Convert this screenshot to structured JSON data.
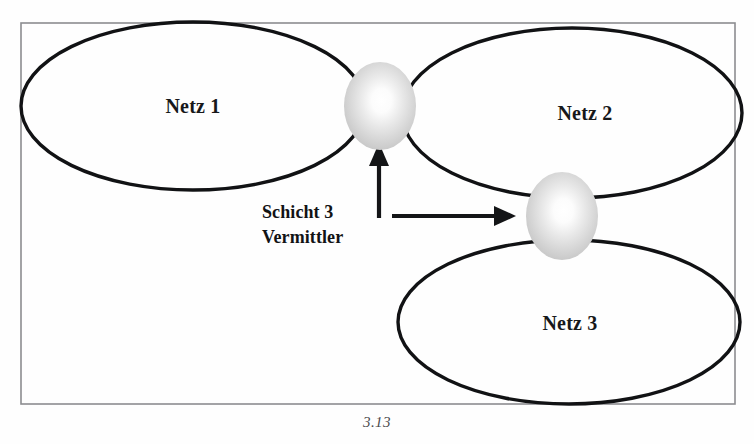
{
  "figure": {
    "caption": "3.13",
    "background_color": "#fefefe",
    "frame_color": "#8c8d90",
    "outline_color": "#111214",
    "text_color": "#17181a",
    "node_fill_center": "#ffffff",
    "node_fill_edge": "#c9c9c9"
  },
  "networks": [
    {
      "id": "netz-1",
      "label": "Netz 1",
      "cx": 193,
      "cy": 106,
      "rx": 172,
      "ry": 84,
      "label_x": 193,
      "label_y": 113
    },
    {
      "id": "netz-2",
      "label": "Netz 2",
      "cx": 572,
      "cy": 113,
      "rx": 170,
      "ry": 85,
      "label_x": 585,
      "label_y": 120
    },
    {
      "id": "netz-3",
      "label": "Netz 3",
      "cx": 569,
      "cy": 322,
      "rx": 171,
      "ry": 82,
      "label_x": 570,
      "label_y": 330
    }
  ],
  "nodes": [
    {
      "id": "gateway-node-1",
      "name": "router-sphere-upper",
      "cx": 380,
      "cy": 106,
      "rx": 36,
      "ry": 44
    },
    {
      "id": "gateway-node-2",
      "name": "router-sphere-lower",
      "cx": 562,
      "cy": 216,
      "rx": 36,
      "ry": 44
    }
  ],
  "annotation": {
    "line1": "Schicht 3",
    "line2": "Vermittler",
    "line1_x": 262,
    "line1_y": 218,
    "line2_x": 262,
    "line2_y": 243
  },
  "arrows": [
    {
      "id": "arrow-up-to-node-1",
      "direction": "up",
      "x1": 379,
      "y1": 218,
      "x2": 379,
      "y2": 152
    },
    {
      "id": "arrow-right-to-node-2",
      "direction": "right",
      "x1": 392,
      "y1": 216,
      "x2": 516,
      "y2": 216
    }
  ],
  "frame": {
    "x": 21,
    "y": 23,
    "width": 714,
    "height": 381
  },
  "caption_position": {
    "x": 377,
    "y": 427
  }
}
